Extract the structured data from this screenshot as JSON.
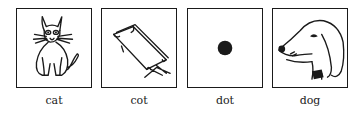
{
  "panels": [
    {
      "label": "cat",
      "icon": "cat-icon"
    },
    {
      "label": "cot",
      "icon": "cot-icon"
    },
    {
      "label": "dot",
      "icon": "dot-icon"
    },
    {
      "label": "dog",
      "icon": "dog-icon"
    }
  ],
  "colors": {
    "ink": "#1a1a1a",
    "background": "#ffffff"
  }
}
